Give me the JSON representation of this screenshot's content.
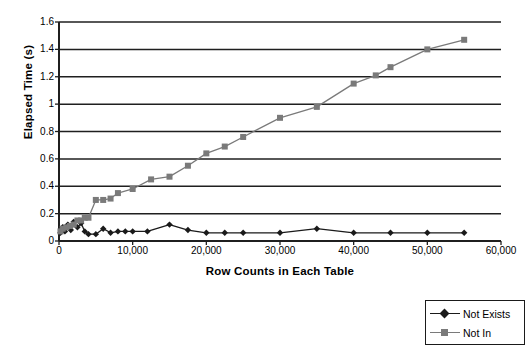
{
  "chart_data": {
    "type": "line",
    "title": "",
    "xlabel": "Row Counts in Each Table",
    "ylabel": "Elapsed Time (s)",
    "xlim": [
      0,
      60000
    ],
    "ylim": [
      0,
      1.6
    ],
    "grid": "horizontal",
    "legend_position": "below-right",
    "xticks": [
      0,
      10000,
      20000,
      30000,
      40000,
      50000,
      60000
    ],
    "xtick_labels": [
      "0",
      "10,000",
      "20,000",
      "30,000",
      "40,000",
      "50,000",
      "60,000"
    ],
    "yticks": [
      0,
      0.2,
      0.4,
      0.6,
      0.8,
      1,
      1.2,
      1.4,
      1.6
    ],
    "ytick_labels": [
      "0",
      "0.2",
      "0.4",
      "0.6",
      "0.8",
      "1",
      "1.2",
      "1.4",
      "1.6"
    ],
    "series": [
      {
        "name": "Not Exists",
        "color": "#1a1a1a",
        "marker": "diamond",
        "x": [
          200,
          500,
          800,
          1200,
          1600,
          2000,
          2500,
          3000,
          3500,
          4000,
          5000,
          6000,
          7000,
          8000,
          9000,
          10000,
          12000,
          15000,
          17500,
          20000,
          22500,
          25000,
          30000,
          35000,
          40000,
          45000,
          50000,
          55000
        ],
        "y": [
          0.06,
          0.1,
          0.07,
          0.12,
          0.08,
          0.14,
          0.1,
          0.13,
          0.07,
          0.05,
          0.05,
          0.09,
          0.06,
          0.07,
          0.07,
          0.07,
          0.07,
          0.12,
          0.08,
          0.06,
          0.06,
          0.06,
          0.06,
          0.09,
          0.06,
          0.06,
          0.06,
          0.06
        ]
      },
      {
        "name": "Not In",
        "color": "#7a7a7a",
        "marker": "square",
        "x": [
          200,
          500,
          1000,
          1500,
          2000,
          2500,
          3000,
          3500,
          4000,
          5000,
          6000,
          7000,
          8000,
          10000,
          12500,
          15000,
          17500,
          20000,
          22500,
          25000,
          30000,
          35000,
          40000,
          43000,
          45000,
          50000,
          55000
        ],
        "y": [
          0.07,
          0.09,
          0.1,
          0.11,
          0.12,
          0.15,
          0.15,
          0.17,
          0.17,
          0.3,
          0.3,
          0.31,
          0.35,
          0.38,
          0.45,
          0.47,
          0.55,
          0.64,
          0.69,
          0.76,
          0.9,
          0.98,
          1.15,
          1.21,
          1.27,
          1.4,
          1.47
        ]
      }
    ]
  },
  "legend": {
    "items": [
      {
        "label": "Not Exists"
      },
      {
        "label": "Not In"
      }
    ]
  }
}
